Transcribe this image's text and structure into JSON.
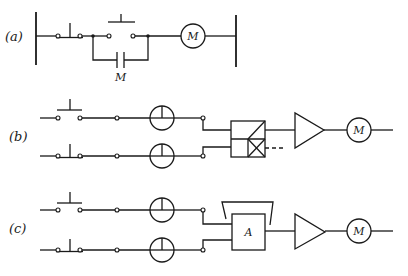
{
  "figure": {
    "panels": [
      {
        "id": "a",
        "label": "(a)",
        "motor_label": "M",
        "holding_contact_label": "M",
        "elements": [
          "left-rail",
          "stop-switch-nc",
          "start-switch-no",
          "holding-contact-M",
          "motor-M",
          "right-rail"
        ]
      },
      {
        "id": "b",
        "label": "(b)",
        "motor_label": "M",
        "elements": [
          "switch-no",
          "switch-nc",
          "sensor-1",
          "sensor-2",
          "logic-gate-block",
          "amplifier",
          "motor-M"
        ]
      },
      {
        "id": "c",
        "label": "(c)",
        "motor_label": "M",
        "block_label": "A",
        "elements": [
          "switch-no",
          "switch-nc",
          "sensor-1",
          "sensor-2",
          "block-A-with-feedback",
          "amplifier",
          "motor-M"
        ]
      }
    ]
  },
  "colors": {
    "line": "#1a1a1a",
    "background": "#ffffff"
  }
}
